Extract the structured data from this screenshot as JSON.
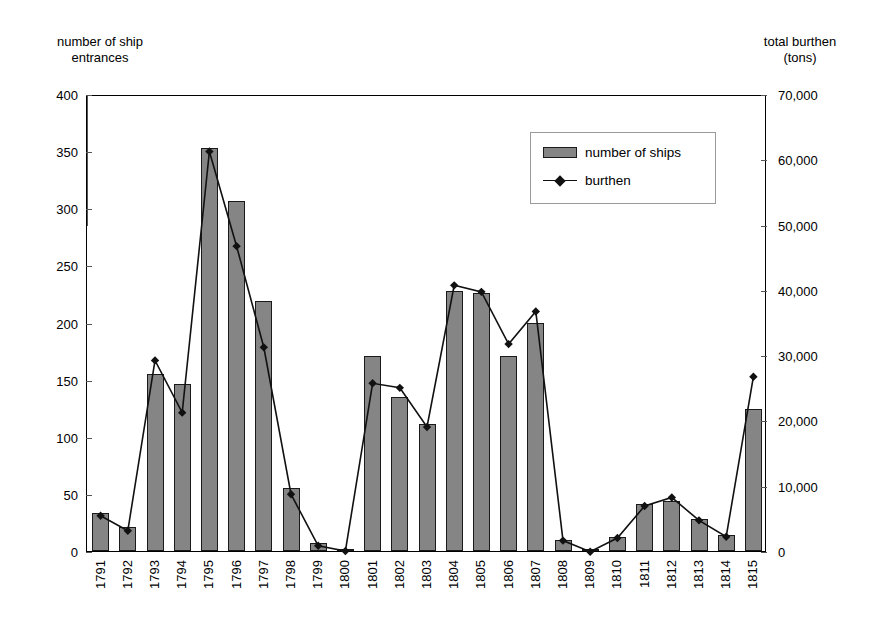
{
  "chart_data": {
    "type": "bar",
    "title": "",
    "xlabel": "",
    "ylabel": "number of ship entrances",
    "y2label": "total burthen (tons)",
    "grid": false,
    "legend_position": "upper-center-right",
    "ylim": [
      0,
      400
    ],
    "y2lim": [
      0,
      70000
    ],
    "yticks": [
      "0",
      "50",
      "100",
      "150",
      "200",
      "250",
      "300",
      "350",
      "400"
    ],
    "y2ticks": [
      "0",
      "10,000",
      "20,000",
      "30,000",
      "40,000",
      "50,000",
      "60,000",
      "70,000"
    ],
    "categories": [
      "1791",
      "1792",
      "1793",
      "1794",
      "1795",
      "1796",
      "1797",
      "1798",
      "1799",
      "1800",
      "1801",
      "1802",
      "1803",
      "1804",
      "1805",
      "1806",
      "1807",
      "1808",
      "1809",
      "1810",
      "1811",
      "1812",
      "1813",
      "1814",
      "1815"
    ],
    "series": [
      {
        "name": "number of ships",
        "axis": "left",
        "kind": "bar",
        "color": "#858585",
        "values": [
          33,
          21,
          155,
          146,
          353,
          306,
          219,
          55,
          7,
          1,
          171,
          135,
          111,
          228,
          226,
          171,
          200,
          10,
          1,
          12,
          41,
          44,
          28,
          14,
          124
        ]
      },
      {
        "name": "burthen",
        "axis": "right",
        "kind": "line",
        "color": "#111111",
        "marker": "diamond",
        "values": [
          5700,
          3400,
          29500,
          21500,
          61500,
          47000,
          31500,
          9000,
          1100,
          300,
          26000,
          25300,
          19300,
          41000,
          40000,
          32000,
          37000,
          1900,
          200,
          2300,
          7200,
          8500,
          5000,
          2500,
          27000
        ]
      }
    ]
  },
  "labels": {
    "left_axis_title": "number of ship\nentrances",
    "right_axis_title": "total burthen\n(tons)"
  },
  "legend": {
    "items": [
      {
        "label": "number of ships",
        "icon": "bar-swatch"
      },
      {
        "label": "burthen",
        "icon": "line-diamond-swatch"
      }
    ]
  }
}
